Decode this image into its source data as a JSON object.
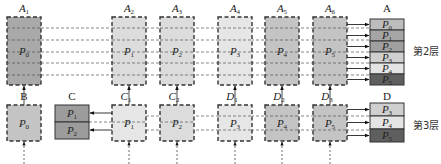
{
  "colors": {
    "dark": "#a9a9a9",
    "medium": "#c4c4c4",
    "light": "#dcdcdc",
    "lighter": "#e6e6e6",
    "stackP0": "#bdbdbd",
    "stackP1": "#a5a5a5",
    "stackP2": "#a0a0a0",
    "stackP3": "#cfcfcf",
    "stackP4": "#e4e4e4",
    "stackP5": "#5f5f5f",
    "stackC": "#9c9c9c"
  },
  "top_row": {
    "columns": [
      {
        "label": "A",
        "sub": "1",
        "part": "P",
        "part_sub": "0",
        "x": 7,
        "fill": "dark"
      },
      {
        "label": "A",
        "sub": "2",
        "part": "P",
        "part_sub": "1",
        "x": 112,
        "fill": "light"
      },
      {
        "label": "A",
        "sub": "3",
        "part": "P",
        "part_sub": "2",
        "x": 160,
        "fill": "light"
      },
      {
        "label": "A",
        "sub": "4",
        "part": "P",
        "part_sub": "3",
        "x": 218,
        "fill": "lighter"
      },
      {
        "label": "A",
        "sub": "5",
        "part": "P",
        "part_sub": "4",
        "x": 265,
        "fill": "medium"
      },
      {
        "label": "A",
        "sub": "6",
        "part": "P",
        "part_sub": "5",
        "x": 313,
        "fill": "medium"
      }
    ]
  },
  "stack_A": {
    "label": "A",
    "cells": [
      {
        "part": "P",
        "sub": "0",
        "fill": "stackP0"
      },
      {
        "part": "P",
        "sub": "1",
        "fill": "stackP1"
      },
      {
        "part": "P",
        "sub": "2",
        "fill": "stackP2"
      },
      {
        "part": "P",
        "sub": "3",
        "fill": "stackP3"
      },
      {
        "part": "P",
        "sub": "4",
        "fill": "stackP4"
      },
      {
        "part": "P",
        "sub": "5",
        "fill": "stackP5"
      }
    ],
    "layer_label": "第2层"
  },
  "bottom_row": {
    "columns": [
      {
        "label": "B",
        "sub": "",
        "part": "P",
        "part_sub": "0",
        "x": 7,
        "fill": "medium",
        "italic": false
      },
      {
        "label": "C",
        "sub": "1",
        "part": "P",
        "part_sub": "1",
        "x": 112,
        "fill": "lighter",
        "italic": true
      },
      {
        "label": "C",
        "sub": "2",
        "part": "P",
        "part_sub": "2",
        "x": 160,
        "fill": "light",
        "italic": true
      },
      {
        "label": "D",
        "sub": "1",
        "part": "P",
        "part_sub": "3",
        "x": 218,
        "fill": "lighter",
        "italic": true
      },
      {
        "label": "D",
        "sub": "2",
        "part": "P",
        "part_sub": "4",
        "x": 265,
        "fill": "medium",
        "italic": true
      },
      {
        "label": "D",
        "sub": "3",
        "part": "P",
        "part_sub": "5",
        "x": 313,
        "fill": "medium",
        "italic": true
      }
    ]
  },
  "stack_C": {
    "label": "C",
    "cells": [
      {
        "part": "P",
        "sub": "1"
      },
      {
        "part": "P",
        "sub": "2"
      }
    ]
  },
  "stack_D": {
    "label": "D",
    "cells": [
      {
        "part": "P",
        "sub": "3",
        "fill": "stackP3"
      },
      {
        "part": "P",
        "sub": "4",
        "fill": "stackP4"
      },
      {
        "part": "P",
        "sub": "5",
        "fill": "stackP5"
      }
    ],
    "layer_label": "第3层"
  }
}
